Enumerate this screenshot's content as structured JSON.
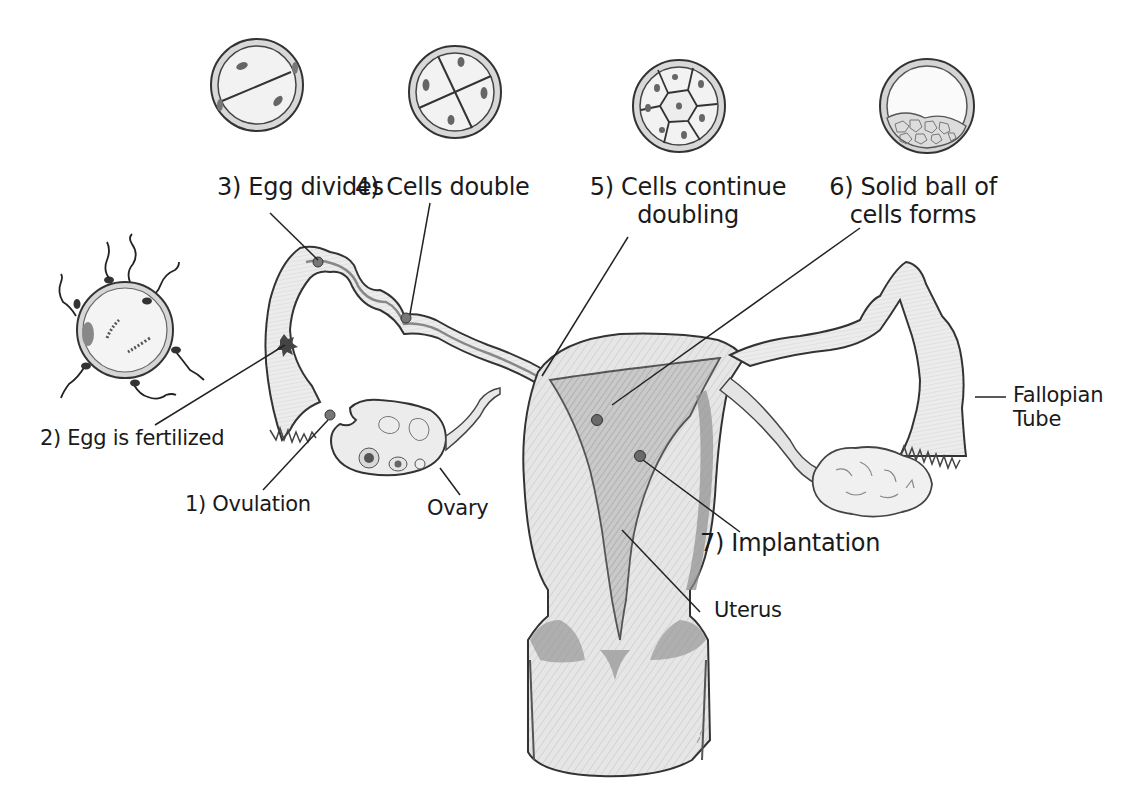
{
  "diagram": {
    "stages": [
      {
        "id": 1,
        "label": "1) Ovulation"
      },
      {
        "id": 2,
        "label": "2) Egg is fertilized"
      },
      {
        "id": 3,
        "label": "3) Egg divides"
      },
      {
        "id": 4,
        "label": "4) Cells double"
      },
      {
        "id": 5,
        "label_line1": "5) Cells continue",
        "label_line2": "doubling"
      },
      {
        "id": 6,
        "label_line1": "6) Solid ball of",
        "label_line2": "cells forms"
      },
      {
        "id": 7,
        "label": "7) Implantation"
      }
    ],
    "anatomy": {
      "ovary": "Ovary",
      "uterus": "Uterus",
      "fallopian_line1": "Fallopian",
      "fallopian_line2": "Tube"
    },
    "cell_icons": [
      {
        "name": "two-cell-embryo",
        "cells": 2
      },
      {
        "name": "four-cell-embryo",
        "cells": 4
      },
      {
        "name": "eight-cell-morula",
        "cells": 8
      },
      {
        "name": "blastocyst",
        "cells": "many"
      }
    ],
    "colors": {
      "line": "#2a2a2a",
      "tissue_fill": "#e4e4e4",
      "tissue_dark": "#9a9a9a",
      "cell_fill": "#efefef",
      "dot": "#6a6a6a"
    }
  }
}
